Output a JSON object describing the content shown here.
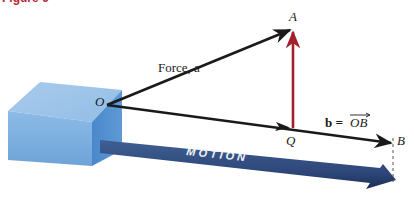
{
  "figure": {
    "title": "Figure 6"
  },
  "labels": {
    "force": "Force, a",
    "point_a": "A",
    "point_o": "O",
    "point_q": "Q",
    "point_b": "B",
    "b_eq": "b = ",
    "ob": "OB",
    "motion": "MOTION"
  },
  "colors": {
    "title": "#b02a3a",
    "vector": "#1a1a1a",
    "projection": "#a3202c",
    "box_top": "#9cc2e6",
    "box_front": "#7fb0df",
    "box_side": "#4f8fd0",
    "motion_arrow": "#2f4a78"
  }
}
